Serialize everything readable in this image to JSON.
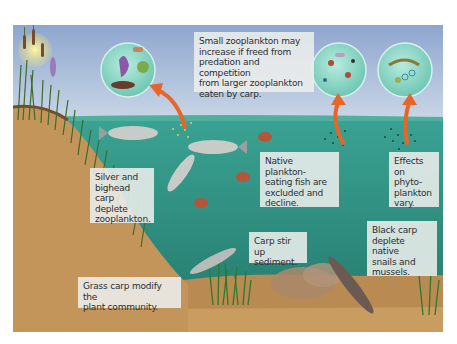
{
  "figure": {
    "colors": {
      "sky_top": "#8ea6cf",
      "sky_bottom": "#c9d6e6",
      "water": "#2f9a8c",
      "water_deep": "#1f6f63",
      "sediment": "#c79a5e",
      "bank": "#c4955a",
      "arrow": "#e8652a",
      "label_bg": "#eceeec"
    }
  },
  "labels": {
    "small_zooplankton": "Small zooplankton may\nincrease if freed from\npredation and competition\nfrom larger zooplankton\neaten by carp.",
    "silver_bighead": "Silver and\nbighead carp\ndeplete\nzooplankton.",
    "native_fish": "Native plankton-\neating fish are\nexcluded and\ndecline.",
    "phytoplankton": "Effects on\nphyto-\nplankton\nvary.",
    "sediment": "Carp stir up\nsediment.",
    "black_carp": "Black carp\ndeplete native\nsnails and\nmussels.",
    "grass_carp": "Grass carp modify the\nplant community."
  },
  "insets": [
    {
      "name": "large-zooplankton",
      "content": "large zooplankton"
    },
    {
      "name": "small-zooplankton",
      "content": "small zooplankton"
    },
    {
      "name": "phytoplankton",
      "content": "phytoplankton"
    }
  ]
}
